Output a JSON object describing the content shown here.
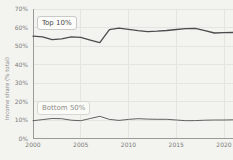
{
  "chart_data": {
    "type": "line",
    "title": "",
    "xlabel": "",
    "ylabel": "Income share (% total)",
    "xlim": [
      2000,
      2021
    ],
    "ylim": [
      0,
      70
    ],
    "grid": true,
    "legend_position": "inline-annotations",
    "x": [
      2000,
      2001,
      2002,
      2003,
      2004,
      2005,
      2006,
      2007,
      2008,
      2009,
      2010,
      2011,
      2012,
      2013,
      2014,
      2015,
      2016,
      2017,
      2018,
      2019,
      2020,
      2021
    ],
    "series": [
      {
        "name": "Top 10%",
        "color": "#4c4c4c",
        "values": [
          55.3,
          54.9,
          53.4,
          53.9,
          55.0,
          54.7,
          53.2,
          51.8,
          58.8,
          59.6,
          59.0,
          58.3,
          57.8,
          58.0,
          58.4,
          58.9,
          59.4,
          59.5,
          58.3,
          57.0,
          57.2,
          57.3
        ]
      },
      {
        "name": "Bottom 50%",
        "color": "#616161",
        "values": [
          9.6,
          10.2,
          10.8,
          10.7,
          9.9,
          9.6,
          10.8,
          12.0,
          10.3,
          9.8,
          10.3,
          10.7,
          10.5,
          10.4,
          10.4,
          10.0,
          9.6,
          9.7,
          9.9,
          10.0,
          10.0,
          10.1
        ]
      }
    ],
    "y_ticks": [
      {
        "v": 0,
        "label": "0%"
      },
      {
        "v": 10,
        "label": "10%"
      },
      {
        "v": 20,
        "label": "20%"
      },
      {
        "v": 30,
        "label": "30%"
      },
      {
        "v": 40,
        "label": "40%"
      },
      {
        "v": 50,
        "label": "50%"
      },
      {
        "v": 60,
        "label": "60%"
      },
      {
        "v": 70,
        "label": "70%"
      }
    ],
    "x_ticks": [
      {
        "v": 2000,
        "label": "2000"
      },
      {
        "v": 2005,
        "label": "2005"
      },
      {
        "v": 2010,
        "label": "2010"
      },
      {
        "v": 2015,
        "label": "2015"
      },
      {
        "v": 2020,
        "label": "2020"
      }
    ]
  },
  "colors": {
    "background": "#f3f3f0",
    "gridline": "#e4e4e1",
    "spine": "#9a9a97",
    "tick_text": "#7d7d7a",
    "annotation_text_dark": "#4a4a48",
    "annotation_text_light": "#8f8f8c",
    "annotation_bg": "#fcfcfa",
    "annotation_border": "#c9c9c6"
  }
}
